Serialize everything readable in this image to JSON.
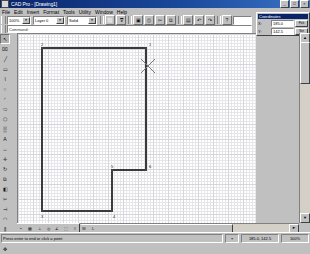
{
  "window": {
    "title": "CAD Pro - [Drawing1]",
    "icon": "app-icon",
    "buttons": [
      {
        "name": "minimize",
        "glyph": "_"
      },
      {
        "name": "maximize",
        "glyph": "□"
      },
      {
        "name": "close",
        "glyph": "×"
      }
    ]
  },
  "menubar": {
    "items": [
      {
        "label": "File"
      },
      {
        "label": "Edit"
      },
      {
        "label": "Insert"
      },
      {
        "label": "Format"
      },
      {
        "label": "Tools"
      },
      {
        "label": "Utility"
      },
      {
        "label": "Window"
      },
      {
        "label": "Help"
      }
    ]
  },
  "toolbar_main": {
    "combo1": {
      "value": "100%",
      "arrow": "▼"
    },
    "combo2": {
      "value": "Layer 0",
      "arrow": "▼"
    },
    "combo3": {
      "value": "Solid",
      "arrow": "▼"
    },
    "buttons": [
      {
        "name": "new-file-icon",
        "glyph": "⬜"
      },
      {
        "name": "open-file-icon",
        "glyph": "ᐁ"
      },
      {
        "name": "save-icon",
        "glyph": "▣"
      },
      {
        "name": "print-icon",
        "glyph": "⎙"
      },
      {
        "name": "cut-icon",
        "glyph": "✂"
      },
      {
        "name": "copy-icon",
        "glyph": "⧉"
      },
      {
        "name": "paste-icon",
        "glyph": "▤"
      },
      {
        "name": "undo-icon",
        "glyph": "↶"
      },
      {
        "name": "redo-icon",
        "glyph": "↷"
      },
      {
        "name": "help-icon",
        "glyph": "?"
      }
    ],
    "command_field": {
      "value": "",
      "placeholder": ""
    }
  },
  "toolbar_secondary": {
    "label": "Command:",
    "value": ""
  },
  "left_toolbar": {
    "tools": [
      {
        "name": "select-arrow-icon",
        "glyph": "↖",
        "selected": true
      },
      {
        "name": "erase-icon",
        "glyph": "⌧",
        "selected": false
      },
      {
        "name": "line-icon",
        "glyph": "╱",
        "selected": false
      },
      {
        "name": "rectangle-icon",
        "glyph": "▭",
        "selected": false
      },
      {
        "name": "polyline-icon",
        "glyph": "⌇",
        "selected": false
      },
      {
        "name": "circle-icon",
        "glyph": "○",
        "selected": false
      },
      {
        "name": "arc-icon",
        "glyph": "◜",
        "selected": false
      },
      {
        "name": "ellipse-icon",
        "glyph": "⬭",
        "selected": false
      },
      {
        "name": "polygon-icon",
        "glyph": "⬡",
        "selected": false
      },
      {
        "name": "hatch-icon",
        "glyph": "▒",
        "selected": false
      },
      {
        "name": "text-icon",
        "glyph": "A",
        "selected": false
      },
      {
        "name": "dimension-icon",
        "glyph": "↔",
        "selected": false
      },
      {
        "name": "move-icon",
        "glyph": "✛",
        "selected": false
      },
      {
        "name": "rotate-icon",
        "glyph": "↻",
        "selected": false
      },
      {
        "name": "copy-object-icon",
        "glyph": "⧉",
        "selected": false
      },
      {
        "name": "mirror-icon",
        "glyph": "◧",
        "selected": false
      },
      {
        "name": "trim-icon",
        "glyph": "✂",
        "selected": false
      },
      {
        "name": "extend-icon",
        "glyph": "⊣",
        "selected": false
      },
      {
        "name": "fillet-icon",
        "glyph": "◠",
        "selected": false
      },
      {
        "name": "offset-icon",
        "glyph": "⫼",
        "selected": false
      },
      {
        "name": "zoom-icon",
        "glyph": "⌕",
        "selected": false
      },
      {
        "name": "pan-icon",
        "glyph": "✥",
        "selected": false
      }
    ]
  },
  "right_panel": {
    "title": "Coordinates",
    "rows": [
      {
        "label": "X:",
        "value": "185.0",
        "button": "Pick"
      },
      {
        "label": "Y:",
        "value": "142.5",
        "button": "Set"
      }
    ]
  },
  "canvas": {
    "cursor": {
      "x": 130,
      "y": 32,
      "name": "crosshair-cursor"
    }
  },
  "drawing": {
    "description": "Closed polyline with an L-shaped notch",
    "points": [
      {
        "id": "1",
        "x": 128,
        "y": 14,
        "label_dx": 3,
        "label_dy": -5
      },
      {
        "id": "2",
        "x": 24,
        "y": 14,
        "label_dx": -1,
        "label_dy": -5
      },
      {
        "id": "3",
        "x": 24,
        "y": 177,
        "label_dx": -1,
        "label_dy": 4
      },
      {
        "id": "4",
        "x": 94,
        "y": 177,
        "label_dx": 1,
        "label_dy": 4
      },
      {
        "id": "5",
        "x": 94,
        "y": 136,
        "label_dx": -1,
        "label_dy": -5
      },
      {
        "id": "6",
        "x": 128,
        "y": 136,
        "label_dx": 3,
        "label_dy": -5
      }
    ],
    "stroke_color": "#3a3a3a",
    "stroke_width": 1.3
  },
  "bottom_toolbar": {
    "buttons": [
      {
        "name": "snap-toggle-icon",
        "glyph": "▪"
      },
      {
        "name": "grid-toggle-icon",
        "glyph": "▦"
      },
      {
        "name": "ortho-toggle-icon",
        "glyph": "⊥"
      },
      {
        "name": "osnap-toggle-icon",
        "glyph": "◎"
      },
      {
        "name": "polar-toggle-icon",
        "glyph": "∠"
      },
      {
        "name": "otrack-toggle-icon",
        "glyph": "⬚"
      },
      {
        "name": "lineweight-toggle-icon",
        "glyph": "≡"
      },
      {
        "name": "model-toggle-icon",
        "glyph": "M"
      },
      {
        "name": "layout-toggle-icon",
        "glyph": "L"
      }
    ]
  },
  "scrollbars": {
    "vertical": {
      "up": "▲",
      "down": "▼"
    },
    "horizontal": {
      "left": "◄",
      "right": "►"
    }
  },
  "statusbar": {
    "message": "Press enter to end or click a point",
    "snap_icon": "⌖",
    "coordinates": "185.0, 142.5",
    "zoom": "100%"
  }
}
